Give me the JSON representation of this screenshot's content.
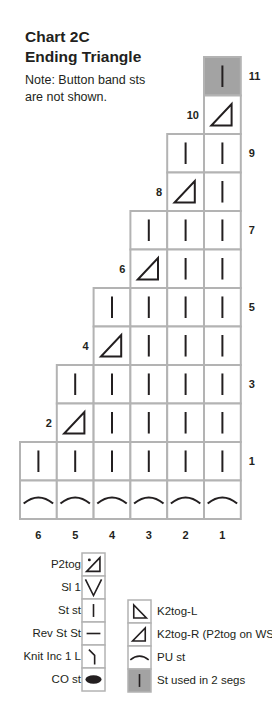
{
  "header": {
    "title_line1": "Chart 2C",
    "title_line2": "Ending Triangle",
    "note_line1": "Note: Button band sts",
    "note_line2": "are not shown."
  },
  "colors": {
    "grid_line": "#b3b3b3",
    "highlight_cell": "#a3a3a3",
    "ink": "#231f20"
  },
  "chart": {
    "columns": 6,
    "column_labels": [
      "6",
      "5",
      "4",
      "3",
      "2",
      "1"
    ],
    "rows": [
      {
        "label": "11",
        "label_side": "right",
        "cells": [
          null,
          null,
          null,
          null,
          null,
          "st-used-2-segs"
        ]
      },
      {
        "label": "10",
        "label_side": "left",
        "cells": [
          null,
          null,
          null,
          null,
          null,
          "k2tog-r"
        ]
      },
      {
        "label": "9",
        "label_side": "right",
        "cells": [
          null,
          null,
          null,
          null,
          "st-st",
          "st-st"
        ]
      },
      {
        "label": "8",
        "label_side": "left",
        "cells": [
          null,
          null,
          null,
          null,
          "k2tog-r",
          "st-st"
        ]
      },
      {
        "label": "7",
        "label_side": "right",
        "cells": [
          null,
          null,
          null,
          "st-st",
          "st-st",
          "st-st"
        ]
      },
      {
        "label": "6",
        "label_side": "left",
        "cells": [
          null,
          null,
          null,
          "k2tog-r",
          "st-st",
          "st-st"
        ]
      },
      {
        "label": "5",
        "label_side": "right",
        "cells": [
          null,
          null,
          "st-st",
          "st-st",
          "st-st",
          "st-st"
        ]
      },
      {
        "label": "4",
        "label_side": "left",
        "cells": [
          null,
          null,
          "k2tog-r",
          "st-st",
          "st-st",
          "st-st"
        ]
      },
      {
        "label": "3",
        "label_side": "right",
        "cells": [
          null,
          "st-st",
          "st-st",
          "st-st",
          "st-st",
          "st-st"
        ]
      },
      {
        "label": "2",
        "label_side": "left",
        "cells": [
          null,
          "k2tog-r",
          "st-st",
          "st-st",
          "st-st",
          "st-st"
        ]
      },
      {
        "label": "1",
        "label_side": "right",
        "cells": [
          "st-st",
          "st-st",
          "st-st",
          "st-st",
          "st-st",
          "st-st"
        ]
      },
      {
        "label": "",
        "label_side": "none",
        "cells": [
          "pu-st",
          "pu-st",
          "pu-st",
          "pu-st",
          "pu-st",
          "pu-st"
        ]
      }
    ]
  },
  "legend": {
    "left": [
      {
        "symbol": "p2tog",
        "label": "P2tog"
      },
      {
        "symbol": "sl-1",
        "label": "Sl 1"
      },
      {
        "symbol": "st-st",
        "label": "St st"
      },
      {
        "symbol": "rev-st-st",
        "label": "Rev St St"
      },
      {
        "symbol": "knit-inc-1-l",
        "label": "Knit Inc 1 L"
      },
      {
        "symbol": "co-st",
        "label": "CO st"
      }
    ],
    "right": [
      {
        "symbol": "k2tog-l",
        "label": "K2tog-L"
      },
      {
        "symbol": "k2tog-r",
        "label": "K2tog-R (P2tog on WS)"
      },
      {
        "symbol": "pu-st",
        "label": "PU st"
      },
      {
        "symbol": "st-used-2-segs",
        "label": "St used in 2 segs"
      }
    ]
  }
}
